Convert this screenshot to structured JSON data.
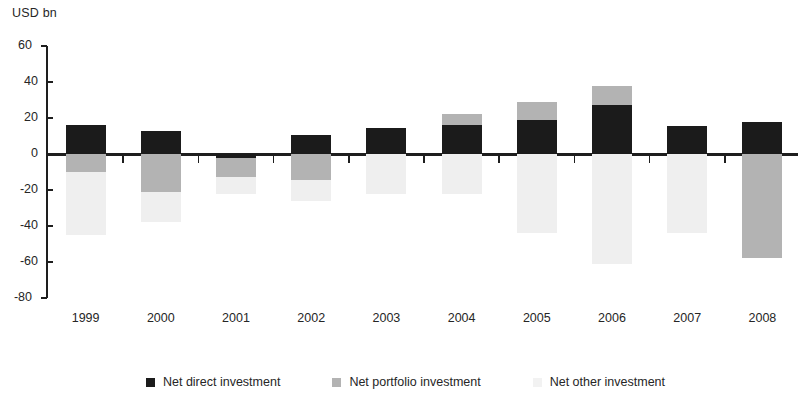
{
  "chart_data": {
    "type": "bar",
    "stacked": true,
    "title": "",
    "subtitle": "",
    "xlabel": "",
    "ylabel": "USD bn",
    "unit_caption": "USD bn",
    "ylim": [
      -80,
      60
    ],
    "ytick_step": 20,
    "ytick_labels": [
      "60",
      "40",
      "20",
      "0",
      "-20",
      "-40",
      "-60",
      "-80"
    ],
    "ytick_values": [
      60,
      40,
      20,
      0,
      -20,
      -40,
      -60,
      -80
    ],
    "grid": false,
    "legend_position": "bottom",
    "categories": [
      "1999",
      "2000",
      "2001",
      "2002",
      "2003",
      "2004",
      "2005",
      "2006",
      "2007",
      "2008"
    ],
    "series": [
      {
        "name": "Net direct investment",
        "color": "#1b1b1b",
        "values": [
          16,
          13,
          -2,
          10.5,
          14.5,
          16,
          19,
          27,
          15.5,
          18
        ]
      },
      {
        "name": "Net portfolio investment",
        "color": "#b3b3b3",
        "values": [
          -10,
          -21,
          -11,
          -14.5,
          0,
          6,
          10,
          11,
          0,
          -58
        ]
      },
      {
        "name": "Net other investment",
        "color": "#efefef",
        "values": [
          -35,
          -17,
          -9,
          -11.5,
          -22,
          -22,
          -44,
          -61,
          -44,
          0
        ]
      }
    ]
  },
  "axis": {
    "caption": "USD bn"
  },
  "legend": {
    "items": [
      {
        "label": "Net direct investment",
        "swatch": "direct"
      },
      {
        "label": "Net portfolio investment",
        "swatch": "portfolio"
      },
      {
        "label": "Net other investment",
        "swatch": "other"
      }
    ]
  }
}
